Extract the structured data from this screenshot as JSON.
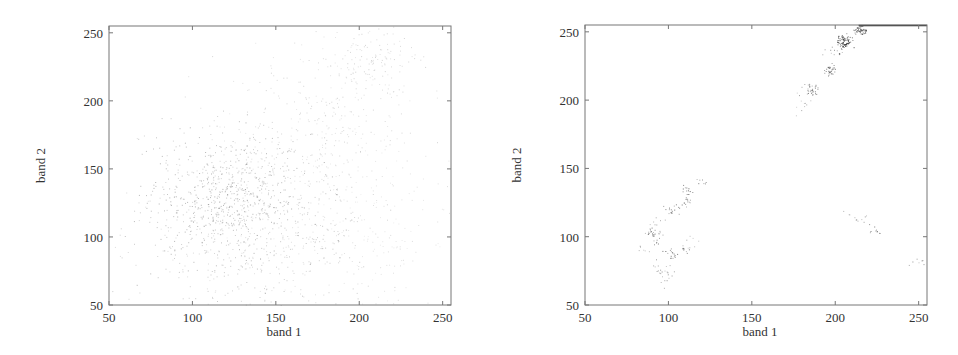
{
  "chart_data": [
    {
      "type": "scatter",
      "title": "",
      "xlabel": "band 1",
      "ylabel": "band 2",
      "xlim": [
        50,
        255
      ],
      "ylim": [
        50,
        255
      ],
      "xticks": [
        50,
        100,
        150,
        200,
        250
      ],
      "yticks": [
        50,
        100,
        150,
        200,
        250
      ],
      "grid": false,
      "legend": null,
      "description": "Sparse faint scatter forming a wedge from ~(85,85) spreading up toward (215,250); dense region around band1 100-140, band2 90-150.",
      "clusters": [
        {
          "x": 120,
          "y": 130,
          "spread": 25,
          "n": 700,
          "opacity": 0.35
        },
        {
          "x": 140,
          "y": 95,
          "spread": 35,
          "n": 500,
          "opacity": 0.25
        },
        {
          "x": 175,
          "y": 175,
          "spread": 30,
          "n": 300,
          "opacity": 0.2
        },
        {
          "x": 205,
          "y": 230,
          "spread": 15,
          "n": 150,
          "opacity": 0.2
        },
        {
          "x": 200,
          "y": 110,
          "spread": 30,
          "n": 200,
          "opacity": 0.15
        }
      ]
    },
    {
      "type": "scatter",
      "title": "",
      "xlabel": "band 1",
      "ylabel": "band 2",
      "xlim": [
        50,
        255
      ],
      "ylim": [
        50,
        255
      ],
      "xticks": [
        50,
        100,
        150,
        200,
        250
      ],
      "yticks": [
        50,
        100,
        150,
        200,
        250
      ],
      "grid": false,
      "legend": null,
      "description": "Clustered scatter concentrated along a diagonal; dense clusters near (205,243), (215,252), (197,222), (186,208), plus low clusters near (90,103), (101,88), (95,74), (111,133), (224,105), (250,81).",
      "clusters": [
        {
          "x": 205,
          "y": 243,
          "spread": 2.5,
          "n": 80,
          "opacity": 0.85
        },
        {
          "x": 215,
          "y": 251,
          "spread": 2,
          "n": 50,
          "opacity": 0.8
        },
        {
          "x": 197,
          "y": 222,
          "spread": 2,
          "n": 30,
          "opacity": 0.7
        },
        {
          "x": 186,
          "y": 208,
          "spread": 2.5,
          "n": 35,
          "opacity": 0.6
        },
        {
          "x": 180,
          "y": 196,
          "spread": 3,
          "n": 10,
          "opacity": 0.4
        },
        {
          "x": 200,
          "y": 236,
          "spread": 3,
          "n": 12,
          "opacity": 0.5
        },
        {
          "x": 111,
          "y": 133,
          "spread": 2,
          "n": 12,
          "opacity": 0.7
        },
        {
          "x": 111,
          "y": 126,
          "spread": 2,
          "n": 14,
          "opacity": 0.6
        },
        {
          "x": 102,
          "y": 120,
          "spread": 2.5,
          "n": 16,
          "opacity": 0.6
        },
        {
          "x": 120,
          "y": 141,
          "spread": 2,
          "n": 8,
          "opacity": 0.5
        },
        {
          "x": 90,
          "y": 103,
          "spread": 2.5,
          "n": 22,
          "opacity": 0.6
        },
        {
          "x": 93,
          "y": 108,
          "spread": 3,
          "n": 10,
          "opacity": 0.45
        },
        {
          "x": 92,
          "y": 96,
          "spread": 1.5,
          "n": 6,
          "opacity": 0.6
        },
        {
          "x": 101,
          "y": 88,
          "spread": 2.5,
          "n": 18,
          "opacity": 0.6
        },
        {
          "x": 111,
          "y": 91,
          "spread": 2,
          "n": 10,
          "opacity": 0.55
        },
        {
          "x": 115,
          "y": 97,
          "spread": 2.5,
          "n": 6,
          "opacity": 0.4
        },
        {
          "x": 97,
          "y": 74,
          "spread": 4,
          "n": 24,
          "opacity": 0.5
        },
        {
          "x": 85,
          "y": 89,
          "spread": 2,
          "n": 6,
          "opacity": 0.4
        },
        {
          "x": 215,
          "y": 114,
          "spread": 2,
          "n": 8,
          "opacity": 0.45
        },
        {
          "x": 224,
          "y": 105,
          "spread": 2,
          "n": 10,
          "opacity": 0.6
        },
        {
          "x": 250,
          "y": 81,
          "spread": 2.5,
          "n": 7,
          "opacity": 0.5
        },
        {
          "x": 207,
          "y": 118,
          "spread": 1.5,
          "n": 3,
          "opacity": 0.35
        }
      ],
      "top_edge_line": {
        "x_from": 214,
        "x_to": 255,
        "y": 255
      }
    }
  ]
}
